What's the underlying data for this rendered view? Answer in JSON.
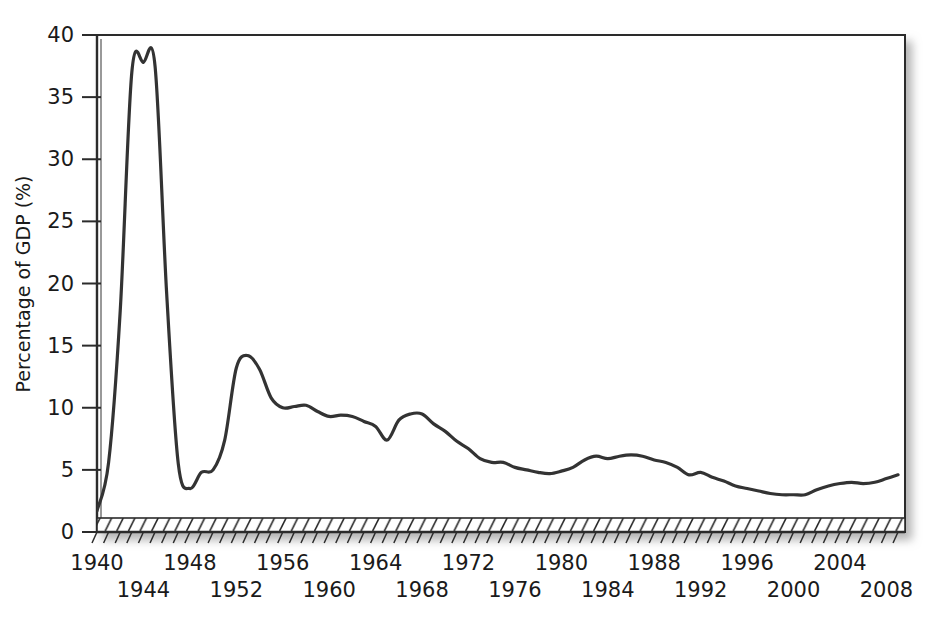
{
  "chart_data": {
    "type": "line",
    "title": "",
    "xlabel": "",
    "ylabel": "Percentage of GDP (%)",
    "xlim": [
      1940,
      2009
    ],
    "ylim": [
      0,
      40
    ],
    "grid": false,
    "legend": null,
    "y_ticks": [
      0,
      5,
      10,
      15,
      20,
      25,
      30,
      35,
      40
    ],
    "y_tick_labels": [
      "0",
      "5",
      "10",
      "15",
      "20",
      "25",
      "30",
      "35",
      "40"
    ],
    "x_ticks_labeled": [
      1940,
      1944,
      1948,
      1952,
      1956,
      1960,
      1964,
      1968,
      1972,
      1976,
      1980,
      1984,
      1988,
      1992,
      1996,
      2000,
      2004,
      2008
    ],
    "x_tick_labels_row1": [
      "1940",
      "1948",
      "1956",
      "1964",
      "1972",
      "1980",
      "1988",
      "1996",
      "2004"
    ],
    "x_tick_labels_row2": [
      "1944",
      "1952",
      "1960",
      "1968",
      "1976",
      "1984",
      "1992",
      "2000",
      "2008"
    ],
    "x_minor_tick_interval": 1,
    "line_color": "#333333",
    "line_width": 3.2,
    "x": [
      1940,
      1941,
      1942,
      1943,
      1944,
      1945,
      1946,
      1947,
      1948,
      1949,
      1950,
      1951,
      1952,
      1953,
      1954,
      1955,
      1956,
      1957,
      1958,
      1959,
      1960,
      1961,
      1962,
      1963,
      1964,
      1965,
      1966,
      1967,
      1968,
      1969,
      1970,
      1971,
      1972,
      1973,
      1974,
      1975,
      1976,
      1977,
      1978,
      1979,
      1980,
      1981,
      1982,
      1983,
      1984,
      1985,
      1986,
      1987,
      1988,
      1989,
      1990,
      1991,
      1992,
      1993,
      1994,
      1995,
      1996,
      1997,
      1998,
      1999,
      2000,
      2001,
      2002,
      2003,
      2004,
      2005,
      2006,
      2007,
      2008,
      2009
    ],
    "values": [
      1.7,
      5.6,
      17.8,
      37.0,
      37.8,
      37.5,
      19.2,
      5.5,
      3.5,
      4.8,
      5.0,
      7.4,
      13.2,
      14.2,
      13.1,
      10.8,
      10.0,
      10.1,
      10.2,
      9.7,
      9.3,
      9.4,
      9.3,
      8.9,
      8.5,
      7.4,
      9.0,
      9.5,
      9.5,
      8.7,
      8.1,
      7.3,
      6.7,
      5.9,
      5.6,
      5.6,
      5.2,
      5.0,
      4.8,
      4.7,
      4.9,
      5.2,
      5.8,
      6.1,
      5.9,
      6.1,
      6.2,
      6.1,
      5.8,
      5.6,
      5.2,
      4.6,
      4.8,
      4.4,
      4.1,
      3.7,
      3.5,
      3.3,
      3.1,
      3.0,
      3.0,
      3.0,
      3.4,
      3.7,
      3.9,
      4.0,
      3.9,
      4.0,
      4.3,
      4.6
    ],
    "annotations": []
  },
  "axis": {
    "y_axis_label": "Percentage of GDP (%)",
    "y_tick_0": "0",
    "y_tick_5": "5",
    "y_tick_10": "10",
    "y_tick_15": "15",
    "y_tick_20": "20",
    "y_tick_25": "25",
    "y_tick_30": "30",
    "y_tick_35": "35",
    "y_tick_40": "40"
  }
}
